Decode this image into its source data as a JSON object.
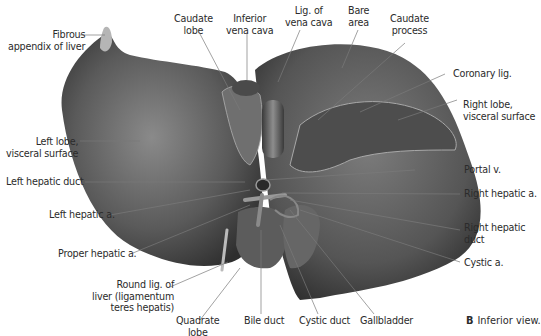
{
  "figure": {
    "caption": {
      "panel": "B",
      "text": "Inferior view."
    },
    "colors": {
      "liver_dark": "#3c3c3c",
      "liver_mid": "#6a6a6a",
      "liver_light": "#9a9a9a",
      "leader_line": "#7a7a7a",
      "text": "#2b2b2b"
    },
    "labels": {
      "fibrous_appendix": [
        "Fibrous",
        "appendix of liver"
      ],
      "caudate_lobe": [
        "Caudate",
        "lobe"
      ],
      "inferior_vena_cava": [
        "Inferior",
        "vena cava"
      ],
      "lig_vena_cava": [
        "Lig. of",
        "vena cava"
      ],
      "bare_area": [
        "Bare",
        "area"
      ],
      "caudate_process": [
        "Caudate",
        "process"
      ],
      "coronary_lig": [
        "Coronary lig."
      ],
      "right_lobe": [
        "Right lobe,",
        "visceral surface"
      ],
      "left_lobe": [
        "Left lobe,",
        "visceral surface"
      ],
      "portal_v": [
        "Portal v."
      ],
      "left_hepatic_duct": [
        "Left hepatic duct"
      ],
      "right_hepatic_a": [
        "Right hepatic a."
      ],
      "left_hepatic_a": [
        "Left hepatic a."
      ],
      "right_hepatic_duct": [
        "Right hepatic",
        "duct"
      ],
      "proper_hepatic_a": [
        "Proper hepatic a."
      ],
      "cystic_a": [
        "Cystic a."
      ],
      "round_lig": [
        "Round lig. of",
        "liver (ligamentum",
        "teres hepatis)"
      ],
      "quadrate_lobe": [
        "Quadrate",
        "lobe"
      ],
      "bile_duct": [
        "Bile duct"
      ],
      "cystic_duct": [
        "Cystic duct"
      ],
      "gallbladder": [
        "Gallbladder"
      ]
    }
  }
}
